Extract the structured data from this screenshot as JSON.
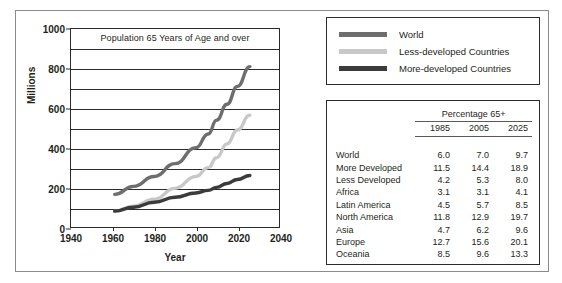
{
  "chart_data": {
    "type": "line",
    "title": "Population 65 Years of Age and over",
    "xlabel": "Year",
    "ylabel": "Millions",
    "xlim": [
      1940,
      2040
    ],
    "ylim": [
      0,
      1000
    ],
    "xticks": [
      1940,
      1960,
      1980,
      2000,
      2020,
      2040
    ],
    "yticks": [
      0,
      200,
      400,
      600,
      800,
      1000
    ],
    "gridlines": [
      100,
      200,
      300,
      400,
      500,
      600,
      700,
      800,
      900
    ],
    "grid": true,
    "legend_position": "outside-right-top",
    "series": [
      {
        "name": "World",
        "color": "#6e6e6e",
        "x": [
          1961,
          1970,
          1980,
          1990,
          2000,
          2006,
          2010,
          2015,
          2020,
          2026
        ],
        "values": [
          165,
          205,
          255,
          320,
          400,
          470,
          540,
          620,
          710,
          810
        ]
      },
      {
        "name": "Less-developed Countries",
        "color": "#c8c8c8",
        "x": [
          1961,
          1970,
          1980,
          1990,
          2000,
          2006,
          2010,
          2015,
          2020,
          2026
        ],
        "values": [
          80,
          105,
          140,
          195,
          255,
          300,
          350,
          420,
          490,
          565
        ]
      },
      {
        "name": "More-developed Countries",
        "color": "#3b3b3b",
        "x": [
          1961,
          1970,
          1980,
          1990,
          2000,
          2006,
          2010,
          2015,
          2020,
          2026
        ],
        "values": [
          80,
          100,
          125,
          150,
          172,
          185,
          200,
          220,
          240,
          260
        ]
      }
    ]
  },
  "chart": {
    "inner_title": "Population 65 Years of Age and over",
    "y_axis_title": "Millions",
    "x_axis_title": "Year",
    "yticks": [
      "1000",
      "800",
      "600",
      "400",
      "200",
      "0"
    ],
    "xticks": [
      "1940",
      "1960",
      "1980",
      "2000",
      "2020",
      "2040"
    ]
  },
  "legend": {
    "items": [
      {
        "label": "World",
        "color": "#6e6e6e"
      },
      {
        "label": "Less-developed Countries",
        "color": "#c8c8c8"
      },
      {
        "label": "More-developed Countries",
        "color": "#3b3b3b"
      }
    ]
  },
  "table": {
    "span_header": "Percentage 65+",
    "name_header": "",
    "year_headers": [
      "1985",
      "2005",
      "2025"
    ],
    "rows": [
      {
        "name": "World",
        "values": [
          "6.0",
          "7.0",
          "9.7"
        ]
      },
      {
        "name": "More Developed",
        "values": [
          "11.5",
          "14.4",
          "18.9"
        ]
      },
      {
        "name": "Less Developed",
        "values": [
          "4.2",
          "5.3",
          "8.0"
        ]
      },
      {
        "name": "Africa",
        "values": [
          "3.1",
          "3.1",
          "4.1"
        ]
      },
      {
        "name": "Latin America",
        "values": [
          "4.5",
          "5.7",
          "8.5"
        ]
      },
      {
        "name": "North America",
        "values": [
          "11.8",
          "12.9",
          "19.7"
        ]
      },
      {
        "name": "Asia",
        "values": [
          "4.7",
          "6.2",
          "9.6"
        ]
      },
      {
        "name": "Europe",
        "values": [
          "12.7",
          "15.6",
          "20.1"
        ]
      },
      {
        "name": "Oceania",
        "values": [
          "8.5",
          "9.6",
          "13.3"
        ]
      }
    ]
  }
}
